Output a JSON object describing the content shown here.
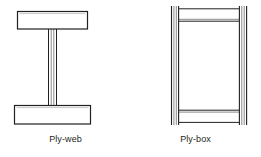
{
  "canvas": {
    "width": 261,
    "height": 157,
    "background": "#ffffff"
  },
  "style": {
    "line_color": "#231f20",
    "inner_line_color": "#808080",
    "fill_color": "#ffffff",
    "text_color": "#231f20"
  },
  "figures": [
    {
      "id": "ply-web",
      "caption": "Ply-web",
      "description": "I-section beam with rectangular top and bottom flanges joined by a thin multi-ply vertical web",
      "parts": {
        "top_flange": {
          "x": 17,
          "y": 11,
          "width": 71,
          "height": 18
        },
        "bottom_flange": {
          "x": 14,
          "y": 105,
          "width": 77,
          "height": 19
        },
        "web": {
          "x": 48,
          "y": 29,
          "width": 9,
          "height": 76,
          "ply_lines": 4
        }
      }
    },
    {
      "id": "ply-box",
      "caption": "Ply-box",
      "description": "Box section beam with two vertical multi-ply side webs and horizontal top and bottom flanges between them",
      "parts": {
        "left_web": {
          "x": 41,
          "y": 6,
          "width": 8,
          "height": 119,
          "ply_lines": 4
        },
        "right_web": {
          "x": 109,
          "y": 6,
          "width": 8,
          "height": 119,
          "ply_lines": 4
        },
        "top_flange": {
          "x": 49,
          "y": 8,
          "width": 60,
          "height": 12
        },
        "bottom_flange": {
          "x": 49,
          "y": 110,
          "width": 60,
          "height": 12
        }
      }
    }
  ]
}
